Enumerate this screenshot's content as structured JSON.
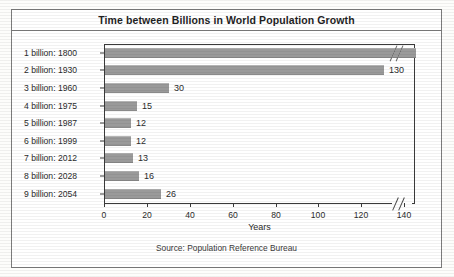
{
  "chart_data": {
    "type": "bar",
    "orientation": "horizontal",
    "title": "Time between Billions in World Population Growth",
    "xlabel": "Years",
    "ylabel": "",
    "categories": [
      "1 billion: 1800",
      "2 billion: 1930",
      "3 billion: 1960",
      "4 billion: 1975",
      "5 billion: 1987",
      "6 billion: 1999",
      "7 billion: 2012",
      "8 billion: 2028",
      "9 billion: 2054"
    ],
    "values": [
      null,
      130,
      30,
      15,
      12,
      12,
      13,
      16,
      26
    ],
    "value_labels": [
      "",
      "130",
      "30",
      "15",
      "12",
      "12",
      "13",
      "16",
      "26"
    ],
    "xticks": [
      0,
      20,
      40,
      60,
      80,
      100,
      120,
      140
    ],
    "xlim": [
      0,
      145
    ],
    "axis_break": true,
    "axis_break_note": "x-axis broken after 140; first bar (1 billion: 1800) extends beyond the break",
    "grid": false,
    "legend": null,
    "bar_color": "#9a9a9a",
    "source": "Source: Population Reference Bureau"
  }
}
